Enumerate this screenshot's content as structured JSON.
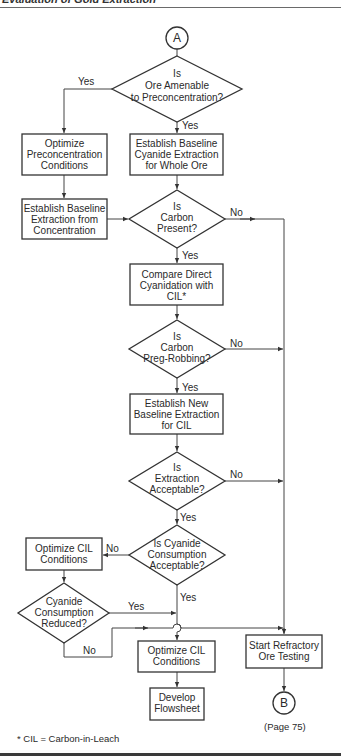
{
  "header": {
    "title_fragment": "Evaluation of Gold Extraction"
  },
  "connectors": {
    "start": "A",
    "end": "B"
  },
  "nodes": {
    "d1": {
      "type": "decision",
      "lines": [
        "Is",
        "Ore Amenable",
        "to Preconcentration?"
      ]
    },
    "p_optimize_precon": {
      "type": "process",
      "lines": [
        "Optimize",
        "Preconcentration",
        "Conditions"
      ]
    },
    "p_baseline_whole": {
      "type": "process",
      "lines": [
        "Establish Baseline",
        "Cyanide Extraction",
        "for Whole Ore"
      ]
    },
    "p_baseline_conc": {
      "type": "process",
      "lines": [
        "Establish Baseline",
        "Extraction from",
        "Concentration"
      ]
    },
    "d_carbon": {
      "type": "decision",
      "lines": [
        "Is",
        "Carbon",
        "Present?"
      ]
    },
    "p_compare": {
      "type": "process",
      "lines": [
        "Compare Direct",
        "Cyanidation with",
        "CIL*"
      ]
    },
    "d_pregrob": {
      "type": "decision",
      "lines": [
        "Is",
        "Carbon",
        "Preg-Robbing?"
      ]
    },
    "p_new_baseline": {
      "type": "process",
      "lines": [
        "Establish New",
        "Baseline Extraction",
        "for CIL"
      ]
    },
    "d_extraction": {
      "type": "decision",
      "lines": [
        "Is",
        "Extraction",
        "Acceptable?"
      ]
    },
    "d_cyanide_acc": {
      "type": "decision",
      "lines": [
        "Is Cyanide",
        "Consumption",
        "Acceptable?"
      ]
    },
    "p_optimize_cil_left": {
      "type": "process",
      "lines": [
        "Optimize CIL",
        "Conditions"
      ]
    },
    "d_cyanide_red": {
      "type": "decision",
      "lines": [
        "Cyanide",
        "Consumption",
        "Reduced?"
      ]
    },
    "p_optimize_cil_center": {
      "type": "process",
      "lines": [
        "Optimize CIL",
        "Conditions"
      ]
    },
    "p_flowsheet": {
      "type": "process",
      "lines": [
        "Develop",
        "Flowsheet"
      ]
    },
    "p_refractory": {
      "type": "process",
      "lines": [
        "Start Refractory",
        "Ore Testing"
      ]
    }
  },
  "edge_labels": {
    "d1_yes_left": "Yes",
    "d1_yes_down": "Yes",
    "carbon_no": "No",
    "carbon_yes": "Yes",
    "pregrob_no": "No",
    "pregrob_yes": "Yes",
    "extraction_no": "No",
    "extraction_yes": "Yes",
    "cyanide_acc_no": "No",
    "cyanide_acc_yes": "Yes",
    "cyanide_red_yes": "Yes",
    "cyanide_red_no": "No"
  },
  "page_ref": "(Page 75)",
  "footnote": "* CIL = Carbon-in-Leach"
}
